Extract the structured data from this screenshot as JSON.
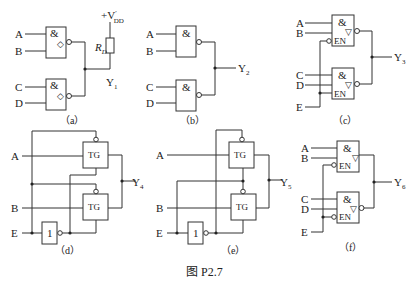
{
  "figure": {
    "caption": "图 P2.7",
    "colors": {
      "line": "#333333",
      "background": "#ffffff"
    }
  },
  "panels": {
    "a": {
      "caption": "（a）",
      "inputs": [
        "A",
        "B",
        "C",
        "D"
      ],
      "gate_symbol": "&",
      "od_symbol": "◇",
      "resistor": "R",
      "resistor_sub": "D",
      "supply": "+V",
      "supply_sub": "DD",
      "supply_prime": "′",
      "output": "Y",
      "output_sub": "1"
    },
    "b": {
      "caption": "（b）",
      "inputs": [
        "A",
        "B",
        "C",
        "D"
      ],
      "gate_symbol": "&",
      "output": "Y",
      "output_sub": "2"
    },
    "c": {
      "caption": "（c）",
      "inputs": [
        "A",
        "B",
        "C",
        "D",
        "E"
      ],
      "gate_symbol": "&",
      "enable": "EN",
      "tristate_symbol": "▽",
      "output": "Y",
      "output_sub": "3"
    },
    "d": {
      "caption": "（d）",
      "inputs": [
        "A",
        "B",
        "E"
      ],
      "tg_label": "TG",
      "inverter_symbol": "1",
      "output": "Y",
      "output_sub": "4"
    },
    "e": {
      "caption": "（e）",
      "inputs": [
        "A",
        "B",
        "E"
      ],
      "tg_label": "TG",
      "inverter_symbol": "1",
      "output": "Y",
      "output_sub": "5"
    },
    "f": {
      "caption": "（f）",
      "inputs": [
        "A",
        "B",
        "C",
        "D",
        "E"
      ],
      "gate_symbol": "&",
      "enable": "EN",
      "tristate_symbol": "▽",
      "output": "Y",
      "output_sub": "6"
    }
  }
}
